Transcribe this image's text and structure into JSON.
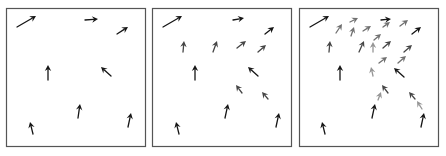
{
  "figure": {
    "colors": {
      "black": "#151515",
      "dark_gray": "#454545",
      "gray": "#707070",
      "light_gray": "#959595",
      "border": "#555555"
    },
    "panels": [
      {
        "id": "panel-1",
        "frame": {
          "x": 6,
          "y": 8,
          "w": 139,
          "h": 138
        },
        "arrows": [
          {
            "x1": 17,
            "y1": 27,
            "x2": 36,
            "y2": 16,
            "c": "black"
          },
          {
            "x1": 85,
            "y1": 20,
            "x2": 98,
            "y2": 19,
            "c": "black"
          },
          {
            "x1": 117,
            "y1": 34,
            "x2": 128,
            "y2": 27,
            "c": "black"
          },
          {
            "x1": 48,
            "y1": 80,
            "x2": 48,
            "y2": 65,
            "c": "black"
          },
          {
            "x1": 111,
            "y1": 76,
            "x2": 101,
            "y2": 67,
            "c": "black"
          },
          {
            "x1": 78,
            "y1": 118,
            "x2": 80,
            "y2": 104,
            "c": "black"
          },
          {
            "x1": 128,
            "y1": 127,
            "x2": 131,
            "y2": 113,
            "c": "black"
          },
          {
            "x1": 33,
            "y1": 134,
            "x2": 30,
            "y2": 122,
            "c": "black"
          }
        ]
      },
      {
        "id": "panel-2",
        "frame": {
          "x": 152,
          "y": 8,
          "w": 139,
          "h": 138
        },
        "arrows": [
          {
            "x1": 163,
            "y1": 27,
            "x2": 182,
            "y2": 16,
            "c": "black"
          },
          {
            "x1": 233,
            "y1": 20,
            "x2": 244,
            "y2": 18,
            "c": "black"
          },
          {
            "x1": 265,
            "y1": 34,
            "x2": 274,
            "y2": 27,
            "c": "black"
          },
          {
            "x1": 195,
            "y1": 80,
            "x2": 195,
            "y2": 65,
            "c": "black"
          },
          {
            "x1": 258,
            "y1": 76,
            "x2": 248,
            "y2": 67,
            "c": "black"
          },
          {
            "x1": 225,
            "y1": 118,
            "x2": 228,
            "y2": 104,
            "c": "black"
          },
          {
            "x1": 276,
            "y1": 127,
            "x2": 279,
            "y2": 113,
            "c": "black"
          },
          {
            "x1": 179,
            "y1": 134,
            "x2": 176,
            "y2": 122,
            "c": "black"
          },
          {
            "x1": 183,
            "y1": 52,
            "x2": 184,
            "y2": 41,
            "c": "dark_gray"
          },
          {
            "x1": 213,
            "y1": 52,
            "x2": 217,
            "y2": 41,
            "c": "dark_gray"
          },
          {
            "x1": 237,
            "y1": 48,
            "x2": 246,
            "y2": 41,
            "c": "dark_gray"
          },
          {
            "x1": 258,
            "y1": 52,
            "x2": 266,
            "y2": 45,
            "c": "dark_gray"
          },
          {
            "x1": 242,
            "y1": 93,
            "x2": 236,
            "y2": 85,
            "c": "dark_gray"
          },
          {
            "x1": 268,
            "y1": 99,
            "x2": 262,
            "y2": 92,
            "c": "dark_gray"
          }
        ]
      },
      {
        "id": "panel-3",
        "frame": {
          "x": 299,
          "y": 8,
          "w": 139,
          "h": 138
        },
        "arrows": [
          {
            "x1": 310,
            "y1": 27,
            "x2": 329,
            "y2": 16,
            "c": "black"
          },
          {
            "x1": 381,
            "y1": 20,
            "x2": 391,
            "y2": 19,
            "c": "black"
          },
          {
            "x1": 412,
            "y1": 34,
            "x2": 421,
            "y2": 27,
            "c": "black"
          },
          {
            "x1": 340,
            "y1": 80,
            "x2": 340,
            "y2": 65,
            "c": "black"
          },
          {
            "x1": 404,
            "y1": 77,
            "x2": 394,
            "y2": 68,
            "c": "black"
          },
          {
            "x1": 372,
            "y1": 118,
            "x2": 375,
            "y2": 104,
            "c": "black"
          },
          {
            "x1": 421,
            "y1": 127,
            "x2": 424,
            "y2": 113,
            "c": "black"
          },
          {
            "x1": 325,
            "y1": 134,
            "x2": 322,
            "y2": 122,
            "c": "black"
          },
          {
            "x1": 329,
            "y1": 52,
            "x2": 330,
            "y2": 41,
            "c": "dark_gray"
          },
          {
            "x1": 359,
            "y1": 52,
            "x2": 364,
            "y2": 41,
            "c": "dark_gray"
          },
          {
            "x1": 383,
            "y1": 48,
            "x2": 391,
            "y2": 41,
            "c": "dark_gray"
          },
          {
            "x1": 404,
            "y1": 52,
            "x2": 412,
            "y2": 45,
            "c": "dark_gray"
          },
          {
            "x1": 388,
            "y1": 93,
            "x2": 382,
            "y2": 85,
            "c": "dark_gray"
          },
          {
            "x1": 415,
            "y1": 99,
            "x2": 409,
            "y2": 92,
            "c": "dark_gray"
          },
          {
            "x1": 336,
            "y1": 33,
            "x2": 342,
            "y2": 24,
            "c": "gray"
          },
          {
            "x1": 350,
            "y1": 22,
            "x2": 358,
            "y2": 18,
            "c": "gray"
          },
          {
            "x1": 351,
            "y1": 36,
            "x2": 354,
            "y2": 27,
            "c": "gray"
          },
          {
            "x1": 363,
            "y1": 31,
            "x2": 371,
            "y2": 26,
            "c": "gray"
          },
          {
            "x1": 383,
            "y1": 27,
            "x2": 390,
            "y2": 22,
            "c": "gray"
          },
          {
            "x1": 400,
            "y1": 26,
            "x2": 408,
            "y2": 20,
            "c": "gray"
          },
          {
            "x1": 374,
            "y1": 40,
            "x2": 381,
            "y2": 34,
            "c": "gray"
          },
          {
            "x1": 373,
            "y1": 52,
            "x2": 373,
            "y2": 42,
            "c": "light_gray"
          },
          {
            "x1": 379,
            "y1": 63,
            "x2": 387,
            "y2": 57,
            "c": "gray"
          },
          {
            "x1": 398,
            "y1": 63,
            "x2": 406,
            "y2": 56,
            "c": "gray"
          },
          {
            "x1": 373,
            "y1": 76,
            "x2": 371,
            "y2": 67,
            "c": "light_gray"
          },
          {
            "x1": 378,
            "y1": 100,
            "x2": 381,
            "y2": 92,
            "c": "light_gray"
          },
          {
            "x1": 422,
            "y1": 109,
            "x2": 417,
            "y2": 101,
            "c": "light_gray"
          }
        ]
      }
    ]
  }
}
